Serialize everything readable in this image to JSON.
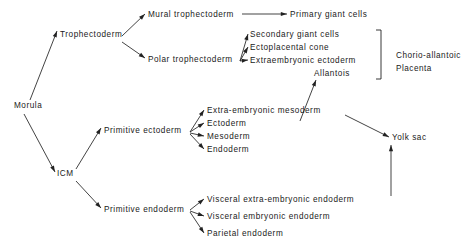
{
  "diagram": {
    "type": "flow-tree",
    "background_color": "#ffffff",
    "line_color": "#222222",
    "text_color": "#1a1a1a",
    "nodes": [
      {
        "id": "morula",
        "label": "Morula",
        "x": 14,
        "y": 108,
        "anchor": "start"
      },
      {
        "id": "trophectoderm",
        "label": "Trophectoderm",
        "x": 60,
        "y": 37,
        "anchor": "start"
      },
      {
        "id": "icm",
        "label": "ICM",
        "x": 57,
        "y": 176,
        "anchor": "start"
      },
      {
        "id": "mural",
        "label": "Mural trophectoderm",
        "x": 148,
        "y": 17,
        "anchor": "start"
      },
      {
        "id": "polar",
        "label": "Polar trophectoderm",
        "x": 148,
        "y": 62,
        "anchor": "start"
      },
      {
        "id": "primary_giant",
        "label": "Primary giant cells",
        "x": 290,
        "y": 17,
        "anchor": "start"
      },
      {
        "id": "secondary_giant",
        "label": "Secondary giant cells",
        "x": 250,
        "y": 37,
        "anchor": "start"
      },
      {
        "id": "ectoplacental",
        "label": "Ectoplacental cone",
        "x": 250,
        "y": 50,
        "anchor": "start"
      },
      {
        "id": "extraemb_ecto",
        "label": "Extraembryonic ectoderm",
        "x": 250,
        "y": 63,
        "anchor": "start"
      },
      {
        "id": "allantois",
        "label": "Allantois",
        "x": 314,
        "y": 76,
        "anchor": "start"
      },
      {
        "id": "prim_ecto",
        "label": "Primitive ectoderm",
        "x": 104,
        "y": 133,
        "anchor": "start"
      },
      {
        "id": "extraemb_meso",
        "label": "Extra-embryonic mesoderm",
        "x": 207,
        "y": 113,
        "anchor": "start"
      },
      {
        "id": "ectoderm",
        "label": "Ectoderm",
        "x": 207,
        "y": 126,
        "anchor": "start"
      },
      {
        "id": "mesoderm",
        "label": "Mesoderm",
        "x": 207,
        "y": 139,
        "anchor": "start"
      },
      {
        "id": "endoderm",
        "label": "Endoderm",
        "x": 207,
        "y": 152,
        "anchor": "start"
      },
      {
        "id": "prim_endo",
        "label": "Primitive endoderm",
        "x": 104,
        "y": 212,
        "anchor": "start"
      },
      {
        "id": "visc_extra_endo",
        "label": "Visceral extra-embryonic endoderm",
        "x": 207,
        "y": 202,
        "anchor": "start"
      },
      {
        "id": "visc_emb_endo",
        "label": "Visceral embryonic endoderm",
        "x": 207,
        "y": 219,
        "anchor": "start"
      },
      {
        "id": "parietal_endo",
        "label": "Parietal endoderm",
        "x": 207,
        "y": 236,
        "anchor": "start"
      },
      {
        "id": "yolk_sac",
        "label": "Yolk sac",
        "x": 392,
        "y": 140,
        "anchor": "start"
      }
    ],
    "group_labels": [
      {
        "id": "chorio_allantoic",
        "line1": "Chorio-allantoic",
        "line2": "Placenta",
        "x": 396,
        "y": 58
      }
    ],
    "bracket": {
      "id": "chorio-allantoic-bracket",
      "x": 381,
      "y_top": 30,
      "y_bottom": 79,
      "tick": 5
    },
    "edges": [
      {
        "id": "morula-to-trophectoderm",
        "from": "Morula",
        "to": "Trophectoderm",
        "x1": 30,
        "y1": 100,
        "x2": 57,
        "y2": 31
      },
      {
        "id": "morula-to-icm",
        "from": "Morula",
        "to": "ICM",
        "x1": 24,
        "y1": 114,
        "x2": 55,
        "y2": 172
      },
      {
        "id": "trophectoderm-to-mural",
        "from": "Trophectoderm",
        "to": "Mural trophectoderm",
        "x1": 122,
        "y1": 36,
        "x2": 145,
        "y2": 14
      },
      {
        "id": "trophectoderm-to-polar",
        "from": "Trophectoderm",
        "to": "Polar trophectoderm",
        "x1": 122,
        "y1": 42,
        "x2": 145,
        "y2": 58
      },
      {
        "id": "mural-to-primary-giant",
        "from": "Mural trophectoderm",
        "to": "Primary giant cells",
        "x1": 242,
        "y1": 14,
        "x2": 287,
        "y2": 14
      },
      {
        "id": "polar-to-secondary-giant",
        "from": "Polar trophectoderm",
        "to": "Secondary giant cells",
        "x1": 240,
        "y1": 61,
        "x2": 248,
        "y2": 34
      },
      {
        "id": "polar-to-ectoplacental",
        "from": "Polar trophectoderm",
        "to": "Ectoplacental cone",
        "x1": 240,
        "y1": 61,
        "x2": 248,
        "y2": 47
      },
      {
        "id": "polar-to-extraemb-ectoderm",
        "from": "Polar trophectoderm",
        "to": "Extraembryonic ectoderm",
        "x1": 240,
        "y1": 61,
        "x2": 248,
        "y2": 60
      },
      {
        "id": "extraemb-meso-to-allantois",
        "from": "Extra-embryonic mesoderm",
        "to": "Allantois",
        "x1": 300,
        "y1": 121,
        "x2": 316,
        "y2": 80
      },
      {
        "id": "icm-to-prim-ectoderm",
        "from": "ICM",
        "to": "Primitive ectoderm",
        "x1": 76,
        "y1": 169,
        "x2": 101,
        "y2": 128
      },
      {
        "id": "icm-to-prim-endoderm",
        "from": "ICM",
        "to": "Primitive endoderm",
        "x1": 76,
        "y1": 181,
        "x2": 101,
        "y2": 208
      },
      {
        "id": "prim-ecto-to-extraemb-meso",
        "from": "Primitive ectoderm",
        "to": "Extra-embryonic mesoderm",
        "x1": 190,
        "y1": 132,
        "x2": 204,
        "y2": 110
      },
      {
        "id": "prim-ecto-to-ectoderm",
        "from": "Primitive ectoderm",
        "to": "Ectoderm",
        "x1": 190,
        "y1": 132,
        "x2": 204,
        "y2": 123
      },
      {
        "id": "prim-ecto-to-mesoderm",
        "from": "Primitive ectoderm",
        "to": "Mesoderm",
        "x1": 190,
        "y1": 133,
        "x2": 204,
        "y2": 136
      },
      {
        "id": "prim-ecto-to-endoderm",
        "from": "Primitive ectoderm",
        "to": "Endoderm",
        "x1": 190,
        "y1": 134,
        "x2": 204,
        "y2": 149
      },
      {
        "id": "prim-endo-to-visc-extra-endo",
        "from": "Primitive endoderm",
        "to": "Visceral extra-embryonic endoderm",
        "x1": 190,
        "y1": 210,
        "x2": 204,
        "y2": 199
      },
      {
        "id": "prim-endo-to-visc-emb-endo",
        "from": "Primitive endoderm",
        "to": "Visceral embryonic endoderm",
        "x1": 190,
        "y1": 211,
        "x2": 204,
        "y2": 216
      },
      {
        "id": "prim-endo-to-parietal-endo",
        "from": "Primitive endoderm",
        "to": "Parietal endoderm",
        "x1": 190,
        "y1": 212,
        "x2": 204,
        "y2": 233
      },
      {
        "id": "extraemb-meso-to-yolk-sac",
        "from": "Extra-embryonic mesoderm",
        "to": "Yolk sac",
        "x1": 345,
        "y1": 115,
        "x2": 389,
        "y2": 137
      },
      {
        "id": "visc-extra-endo-to-yolk-sac",
        "from": "Visceral extra-embryonic endoderm",
        "to": "Yolk sac",
        "x1": 391,
        "y1": 196,
        "x2": 391,
        "y2": 145
      }
    ]
  }
}
